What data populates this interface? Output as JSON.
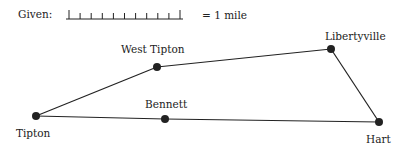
{
  "legend": {
    "given_label": "Given:",
    "scale_text": "= 1 mile",
    "scale_bar": {
      "x1": 66,
      "x2": 183,
      "y": 19,
      "ticks": 11
    }
  },
  "towns": [
    {
      "name": "Tipton",
      "x": 36,
      "y": 116,
      "label_x": 16,
      "label_y": 128
    },
    {
      "name": "West Tipton",
      "x": 157,
      "y": 67,
      "label_x": 121,
      "label_y": 44
    },
    {
      "name": "Libertyville",
      "x": 331,
      "y": 49,
      "label_x": 325,
      "label_y": 31
    },
    {
      "name": "Bennett",
      "x": 165,
      "y": 119,
      "label_x": 145,
      "label_y": 99
    },
    {
      "name": "Hart",
      "x": 379,
      "y": 122,
      "label_x": 366,
      "label_y": 134
    }
  ],
  "roads": [
    [
      "Tipton",
      "West Tipton"
    ],
    [
      "West Tipton",
      "Libertyville"
    ],
    [
      "Libertyville",
      "Hart"
    ],
    [
      "Tipton",
      "Bennett"
    ],
    [
      "Bennett",
      "Hart"
    ]
  ],
  "colors": {
    "ink": "#222222",
    "background": "#ffffff"
  }
}
